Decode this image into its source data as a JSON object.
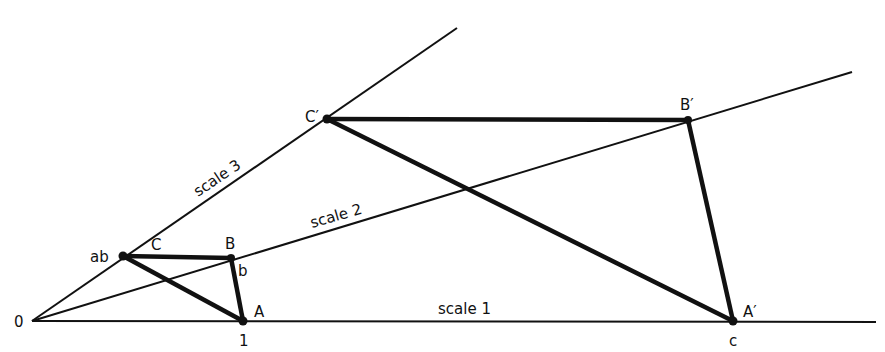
{
  "diagram": {
    "colors": {
      "line": "#111111",
      "background": "#ffffff"
    },
    "origin_label": "0",
    "scales": [
      {
        "label": "scale 1"
      },
      {
        "label": "scale 2"
      },
      {
        "label": "scale 3"
      }
    ],
    "points": {
      "A": "A",
      "B": "B",
      "C": "C",
      "A_prime": "A′",
      "B_prime": "B′",
      "C_prime": "C′"
    },
    "marks": {
      "ab": "ab",
      "b": "b",
      "one": "1",
      "c": "c"
    }
  }
}
